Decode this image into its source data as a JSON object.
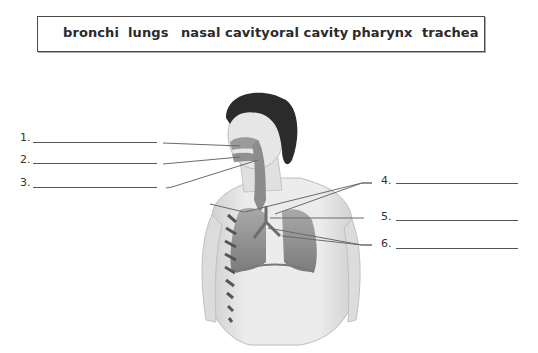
{
  "word_bank": {
    "words": [
      "bronchi",
      "lungs",
      "nasal cavity",
      "oral cavity",
      "pharynx",
      "trachea"
    ]
  },
  "labels": [
    {
      "number": "1.",
      "answer": ""
    },
    {
      "number": "2.",
      "answer": ""
    },
    {
      "number": "3.",
      "answer": ""
    },
    {
      "number": "4.",
      "answer": ""
    },
    {
      "number": "5.",
      "answer": ""
    },
    {
      "number": "6.",
      "answer": ""
    }
  ],
  "figure": {
    "colors": {
      "hair": "#2b2b2b",
      "skin": "#e4e4e4",
      "skin_shade": "#bdbdbd",
      "organ": "#8a8a8a",
      "lines": "#6a6a6a"
    }
  }
}
